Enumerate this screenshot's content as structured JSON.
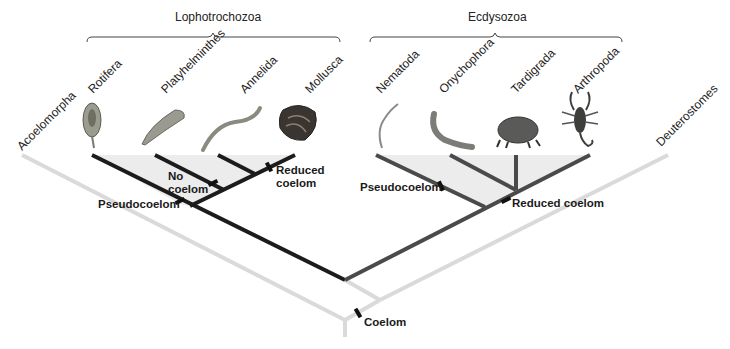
{
  "colors": {
    "lophotrochozoa_branch": "#1c1c1c",
    "ecdysozoa_branch": "#4a4a4a",
    "outgroup_branch": "#d9d9d9",
    "shading": "#ececec",
    "trait_mark": "#111111"
  },
  "groups": [
    {
      "label": "Lophotrochozoa",
      "bracket_x": [
        87,
        340
      ]
    },
    {
      "label": "Ecdysozoa",
      "bracket_x": [
        370,
        622
      ]
    }
  ],
  "taxa": [
    {
      "label": "Acoelomorpha",
      "icon": "none"
    },
    {
      "label": "Rotifera",
      "icon": "rotifer-image"
    },
    {
      "label": "Platyhelminthes",
      "icon": "flatworm-image"
    },
    {
      "label": "Annelida",
      "icon": "segmented-worm-image"
    },
    {
      "label": "Mollusca",
      "icon": "clam-shell-image"
    },
    {
      "label": "Nematoda",
      "icon": "roundworm-image"
    },
    {
      "label": "Onychophora",
      "icon": "velvet-worm-image"
    },
    {
      "label": "Tardigrada",
      "icon": "water-bear-image"
    },
    {
      "label": "Arthropoda",
      "icon": "scorpion-image"
    },
    {
      "label": "Deuterostomes",
      "icon": "none"
    }
  ],
  "traits": {
    "no_coelom": {
      "line1": "No",
      "line2": "coelom"
    },
    "reduced_coelom_loph": {
      "line1": "Reduced",
      "line2": "coelom"
    },
    "pseudocoelom_loph": "Pseudocoelom",
    "pseudocoelom_ecd": "Pseudocoelom",
    "reduced_coelom_ecd": "Reduced coelom",
    "coelom": "Coelom"
  }
}
